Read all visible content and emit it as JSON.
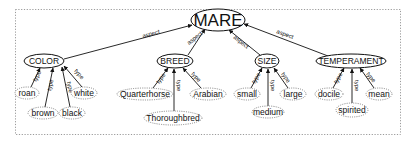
{
  "diagram": {
    "root": {
      "id": "mare",
      "label": "MARE",
      "cx": 218,
      "cy": 20,
      "rx": 27,
      "ry": 11
    },
    "aspects": [
      {
        "id": "color",
        "label": "COLOR",
        "cx": 44,
        "cy": 61,
        "rx": 20,
        "ry": 7
      },
      {
        "id": "breed",
        "label": "BREED",
        "cx": 175,
        "cy": 61,
        "rx": 18,
        "ry": 7
      },
      {
        "id": "size",
        "label": "SIZE",
        "cx": 267,
        "cy": 61,
        "rx": 12,
        "ry": 7
      },
      {
        "id": "temperament",
        "label": "TEMPERAMENT",
        "cx": 351,
        "cy": 61,
        "rx": 35,
        "ry": 7
      }
    ],
    "values": [
      {
        "id": "roan",
        "label": "roan",
        "parent": "color",
        "cx": 27,
        "cy": 93,
        "rx": 12,
        "ry": 6
      },
      {
        "id": "brown",
        "label": "brown",
        "parent": "color",
        "cx": 43,
        "cy": 113,
        "rx": 15,
        "ry": 6
      },
      {
        "id": "black",
        "label": "black",
        "parent": "color",
        "cx": 72,
        "cy": 113,
        "rx": 13,
        "ry": 6
      },
      {
        "id": "white",
        "label": "white",
        "parent": "color",
        "cx": 84,
        "cy": 93,
        "rx": 13,
        "ry": 6
      },
      {
        "id": "quarterhorse",
        "label": "Quarterhorse",
        "parent": "breed",
        "cx": 145,
        "cy": 94,
        "rx": 28,
        "ry": 6
      },
      {
        "id": "thoroughbred",
        "label": "Thoroughbred",
        "parent": "breed",
        "cx": 173,
        "cy": 118,
        "rx": 29,
        "ry": 7
      },
      {
        "id": "arabian",
        "label": "Arabian",
        "parent": "breed",
        "cx": 208,
        "cy": 94,
        "rx": 18,
        "ry": 6
      },
      {
        "id": "small",
        "label": "small",
        "parent": "size",
        "cx": 247,
        "cy": 94,
        "rx": 13,
        "ry": 6
      },
      {
        "id": "medium",
        "label": "medium",
        "parent": "size",
        "cx": 268,
        "cy": 112,
        "rx": 16,
        "ry": 6
      },
      {
        "id": "large",
        "label": "large",
        "parent": "size",
        "cx": 293,
        "cy": 94,
        "rx": 13,
        "ry": 6
      },
      {
        "id": "docile",
        "label": "docile",
        "parent": "temperament",
        "cx": 329,
        "cy": 94,
        "rx": 14,
        "ry": 6
      },
      {
        "id": "spirited",
        "label": "spirited",
        "parent": "temperament",
        "cx": 352,
        "cy": 110,
        "rx": 16,
        "ry": 7
      },
      {
        "id": "mean",
        "label": "mean",
        "parent": "temperament",
        "cx": 379,
        "cy": 94,
        "rx": 13,
        "ry": 6
      }
    ],
    "edge_labels": {
      "aspect": "aspect",
      "type": "type"
    }
  }
}
